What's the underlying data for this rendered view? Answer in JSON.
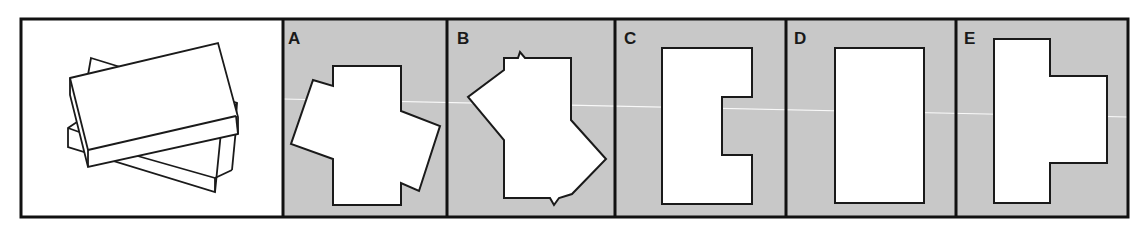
{
  "figure": {
    "colors": {
      "panel_background": "#c8c8c8",
      "reference_background": "#ffffff",
      "stroke": "#1a1a1a",
      "shape_fill": "#ffffff"
    },
    "reference_panel": {
      "description": "Two rectangular boxes stacked at an angle"
    },
    "options": [
      {
        "label": "A",
        "shape": "cross-like polygon of two overlapping rotated rectangles"
      },
      {
        "label": "B",
        "shape": "rotated overlapping rectangles with notches"
      },
      {
        "label": "C",
        "shape": "rectangle with right-side notch"
      },
      {
        "label": "D",
        "shape": "plain rectangle"
      },
      {
        "label": "E",
        "shape": "T-shape with right-side protrusion"
      }
    ]
  }
}
